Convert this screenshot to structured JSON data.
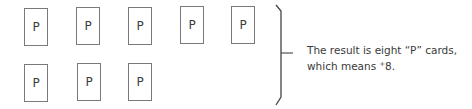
{
  "cards": {
    "row1": [
      {
        "label": "P",
        "x": 24,
        "y": 8
      },
      {
        "label": "P",
        "x": 76,
        "y": 7
      },
      {
        "label": "P",
        "x": 128,
        "y": 7
      },
      {
        "label": "P",
        "x": 180,
        "y": 6
      },
      {
        "label": "P",
        "x": 231,
        "y": 6
      }
    ],
    "row2": [
      {
        "label": "P",
        "x": 24,
        "y": 64
      },
      {
        "label": "P",
        "x": 77,
        "y": 63
      },
      {
        "label": "P",
        "x": 128,
        "y": 63
      }
    ]
  },
  "result": {
    "line1": "The result is eight “P” cards,",
    "line2_prefix": "which means ",
    "sign": "+",
    "value": "8",
    "line2_suffix": "."
  },
  "colors": {
    "card_border": "#7a7a7a",
    "text": "#3a3a3a",
    "brace": "#444444"
  }
}
